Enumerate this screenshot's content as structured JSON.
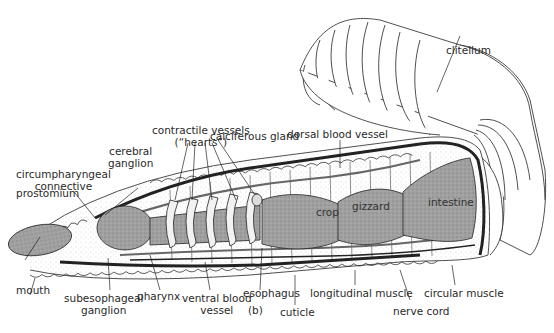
{
  "figure": {
    "panel_label": "(b)",
    "labels": {
      "clitellum": "clitellum",
      "calciferous_gland": "calciferous gland",
      "dorsal_blood_vessel": "dorsal blood vessel",
      "contractile_vessels_1": "contractile vessels",
      "contractile_vessels_2": "(“hearts”)",
      "cerebral_ganglion_1": "cerebral",
      "cerebral_ganglion_2": "ganglion",
      "circumpharyngeal_1": "circumpharyngeal",
      "circumpharyngeal_2": "connective",
      "prostomium": "prostomium",
      "mouth": "mouth",
      "subesophageal_1": "subesophageal",
      "subesophageal_2": "ganglion",
      "pharynx": "pharynx",
      "ventral_vessel_1": "ventral blood",
      "ventral_vessel_2": "vessel",
      "esophagus": "esophagus",
      "cuticle": "cuticle",
      "longitudinal_muscle": "longitudinal muscle",
      "nerve_cord": "nerve cord",
      "circular_muscle": "circular muscle",
      "crop": "crop",
      "gizzard": "gizzard",
      "intestine": "intestine"
    },
    "colors": {
      "gut_fill": "#9a9a9a",
      "line": "#1a1a1a",
      "background": "#ffffff"
    }
  }
}
